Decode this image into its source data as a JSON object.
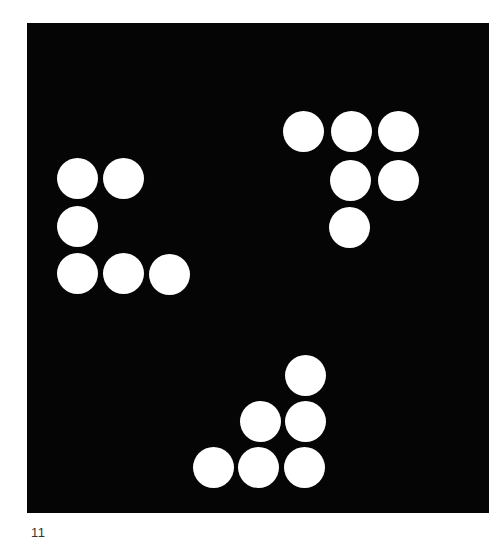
{
  "figure": {
    "background_color": "#050505",
    "dot_color": "#ffffff",
    "caption": "11",
    "groups": [
      {
        "name": "left-group",
        "dots": [
          [
            77,
            178
          ],
          [
            123,
            178
          ],
          [
            77,
            226
          ],
          [
            77,
            273
          ],
          [
            123,
            273
          ],
          [
            169,
            274
          ]
        ]
      },
      {
        "name": "top-right-group",
        "dots": [
          [
            303,
            131
          ],
          [
            351,
            131
          ],
          [
            398,
            131
          ],
          [
            350,
            180
          ],
          [
            398,
            180
          ],
          [
            349,
            227
          ]
        ]
      },
      {
        "name": "bottom-group",
        "dots": [
          [
            305,
            375
          ],
          [
            260,
            421
          ],
          [
            305,
            421
          ],
          [
            213,
            467
          ],
          [
            258,
            467
          ],
          [
            304,
            467
          ]
        ]
      }
    ]
  }
}
